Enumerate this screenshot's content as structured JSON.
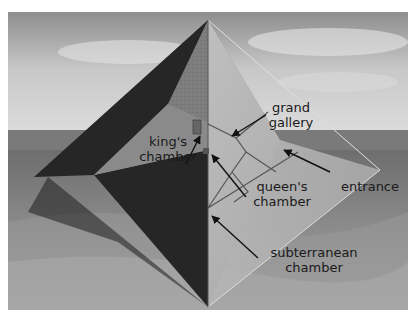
{
  "diagram": {
    "labels": {
      "grand_gallery": [
        "grand",
        "gallery"
      ],
      "kings_chamber": [
        "king's",
        "chamber"
      ],
      "queens_chamber": [
        "queen's",
        "chamber"
      ],
      "entrance": [
        "entrance"
      ],
      "subterranean_chamber": [
        "subterranean",
        "chamber"
      ]
    },
    "colors": {
      "sky_top": "#9a9a9a",
      "sky_bottom": "#d8d8d8",
      "sand": "#8a8a8a",
      "dark_face": "#2a2a2a",
      "mid_face": "#7c7c7c",
      "glass_face": "#c4c4c4",
      "label_text": "#1a1a1a"
    }
  }
}
